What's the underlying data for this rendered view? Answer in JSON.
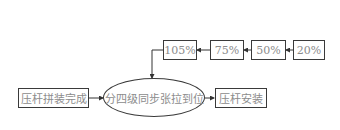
{
  "diagram": {
    "type": "flowchart",
    "nodes": {
      "start": "压杆拼装完成",
      "center": "分四级同步张拉到位",
      "end": "压杆安装",
      "stage1": "20%",
      "stage2": "50%",
      "stage3": "75%",
      "stage4": "105%"
    },
    "edges": [
      {
        "from": "20%",
        "to": "50%"
      },
      {
        "from": "50%",
        "to": "75%"
      },
      {
        "from": "75%",
        "to": "105%"
      },
      {
        "from": "105%",
        "to": "分四级同步张拉到位"
      },
      {
        "from": "压杆拼装完成",
        "to": "分四级同步张拉到位"
      },
      {
        "from": "分四级同步张拉到位",
        "to": "压杆安装"
      }
    ]
  }
}
